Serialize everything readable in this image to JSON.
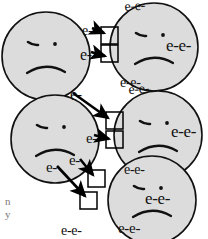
{
  "diagram": {
    "style": {
      "circle_fill": "#dcdcdc",
      "circle_stroke": "#111111",
      "arrow_color": "#000000",
      "box_fill": "#ffffff",
      "box_stroke": "#000000",
      "background": "#ffffff"
    },
    "particles": [
      {
        "id": "p1",
        "name": "particle-top-left",
        "face": "sad",
        "cx": 46,
        "cy": 56,
        "r": 44
      },
      {
        "id": "p2",
        "name": "particle-top-right",
        "face": "sad",
        "cx": 154,
        "cy": 47,
        "r": 44
      },
      {
        "id": "p3",
        "name": "particle-middle-left",
        "face": "sad",
        "cx": 55,
        "cy": 139,
        "r": 44
      },
      {
        "id": "p4",
        "name": "particle-middle-right",
        "face": "sad",
        "cx": 158,
        "cy": 135,
        "r": 44
      },
      {
        "id": "p5",
        "name": "particle-bottom-right",
        "face": "sad",
        "cx": 152,
        "cy": 200,
        "r": 44
      }
    ],
    "electron_labels": [
      {
        "id": "l1",
        "text": "e-",
        "x": 82,
        "y": 24,
        "size": 14,
        "rot": 0,
        "owner": "p1"
      },
      {
        "id": "l2",
        "text": "e-",
        "x": 80,
        "y": 48,
        "size": 16,
        "rot": 0,
        "owner": "p1"
      },
      {
        "id": "l3",
        "text": "e-",
        "x": 70,
        "y": 88,
        "size": 16,
        "rot": 0,
        "owner": "p1"
      },
      {
        "id": "l4",
        "text": "e-e-",
        "x": 124,
        "y": 0,
        "size": 14,
        "rot": -4,
        "owner": "p2"
      },
      {
        "id": "l5",
        "text": "e-e-",
        "x": 166,
        "y": 38,
        "size": 17,
        "rot": 0,
        "owner": "p2"
      },
      {
        "id": "l6",
        "text": "e-e-",
        "x": 120,
        "y": 76,
        "size": 14,
        "rot": 0,
        "owner": "p2"
      },
      {
        "id": "l7",
        "text": "e-",
        "x": 86,
        "y": 131,
        "size": 15,
        "rot": 0,
        "owner": "p3"
      },
      {
        "id": "l8",
        "text": "e-",
        "x": 46,
        "y": 160,
        "size": 15,
        "rot": 0,
        "owner": "p3"
      },
      {
        "id": "l9",
        "text": "e-",
        "x": 69,
        "y": 153,
        "size": 15,
        "rot": 0,
        "owner": "p3"
      },
      {
        "id": "l10",
        "text": "e-e-",
        "x": 128,
        "y": 83,
        "size": 14,
        "rot": -4,
        "owner": "p4"
      },
      {
        "id": "l11",
        "text": "e-e-",
        "x": 171,
        "y": 124,
        "size": 17,
        "rot": 0,
        "owner": "p4"
      },
      {
        "id": "l12",
        "text": "e-e-",
        "x": 124,
        "y": 163,
        "size": 14,
        "rot": 0,
        "owner": "p4"
      },
      {
        "id": "l13",
        "text": "e-e-",
        "x": 145,
        "y": 191,
        "size": 17,
        "rot": 0,
        "owner": "p5"
      },
      {
        "id": "l14",
        "text": "e-e-",
        "x": 118,
        "y": 221,
        "size": 15,
        "rot": 0,
        "owner": "p5"
      },
      {
        "id": "l15",
        "text": "e-e-",
        "x": 61,
        "y": 224,
        "size": 14,
        "rot": 0,
        "owner": "p3"
      }
    ],
    "vacancy_boxes": [
      {
        "id": "b1",
        "name": "vacancy-box-1",
        "x": 101,
        "y": 27,
        "w": 17,
        "h": 17
      },
      {
        "id": "b2",
        "name": "vacancy-box-2",
        "x": 101,
        "y": 45,
        "w": 17,
        "h": 17
      },
      {
        "id": "b3",
        "name": "vacancy-box-3",
        "x": 106,
        "y": 112,
        "w": 17,
        "h": 17
      },
      {
        "id": "b4",
        "name": "vacancy-box-4",
        "x": 106,
        "y": 131,
        "w": 17,
        "h": 17
      },
      {
        "id": "b5",
        "name": "vacancy-box-5",
        "x": 88,
        "y": 170,
        "w": 17,
        "h": 17
      },
      {
        "id": "b6",
        "name": "vacancy-box-6",
        "x": 80,
        "y": 192,
        "w": 17,
        "h": 17
      }
    ],
    "transfer_arrows": [
      {
        "id": "a1",
        "name": "transfer-arrow-1",
        "x1": 92,
        "y1": 28,
        "x2": 104,
        "y2": 33
      },
      {
        "id": "a2",
        "name": "transfer-arrow-2",
        "x1": 91,
        "y1": 52,
        "x2": 105,
        "y2": 56
      },
      {
        "id": "a3",
        "name": "transfer-arrow-3",
        "x1": 73,
        "y1": 93,
        "x2": 108,
        "y2": 118
      },
      {
        "id": "a4",
        "name": "transfer-arrow-4",
        "x1": 94,
        "y1": 135,
        "x2": 109,
        "y2": 139
      },
      {
        "id": "a5",
        "name": "transfer-arrow-5",
        "x1": 80,
        "y1": 159,
        "x2": 93,
        "y2": 175
      },
      {
        "id": "a6",
        "name": "transfer-arrow-6",
        "x1": 57,
        "y1": 166,
        "x2": 85,
        "y2": 196
      }
    ],
    "corner_note": {
      "line1": "n",
      "line2": "y"
    }
  }
}
